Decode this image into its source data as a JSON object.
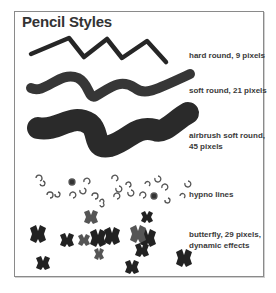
{
  "title": "Pencil Styles",
  "styles": [
    {
      "label": "hard round, 9 pixels"
    },
    {
      "label": "soft round, 21 pixels"
    },
    {
      "label": "airbrush soft round,",
      "label2": "45 pixels"
    },
    {
      "label": "hypno lines"
    },
    {
      "label": "butterfly, 29 pixels,",
      "label2": "dynamic effects"
    }
  ],
  "colors": {
    "stroke": "#2a2a2a",
    "frame": "#8a8a8a",
    "text": "#333333"
  }
}
